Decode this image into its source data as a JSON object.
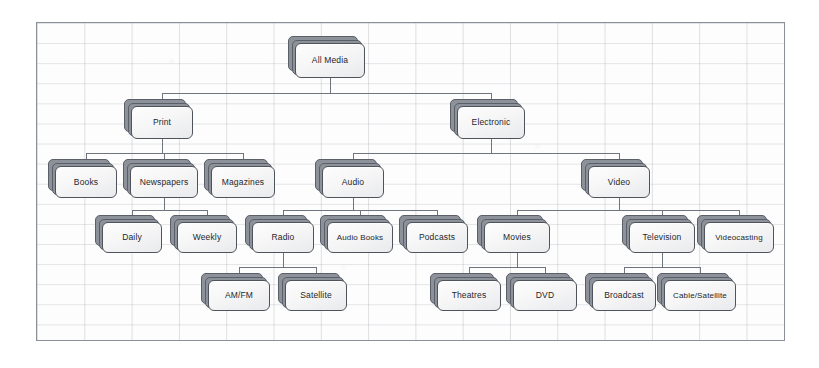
{
  "diagram": {
    "type": "tree",
    "canvas": {
      "background": "#fdfdfd",
      "grid": true,
      "border_color": "#8a8f99"
    },
    "node_style": {
      "fill": "#f6f6f7",
      "border": "#4f545c",
      "stack_fill": "#8d9199",
      "connector": "#6f757f"
    },
    "levels": [
      {
        "index": 0,
        "labels": [
          "All Media"
        ]
      },
      {
        "index": 1,
        "labels": [
          "Print",
          "Electronic"
        ]
      },
      {
        "index": 2,
        "labels": [
          "Books",
          "Newspapers",
          "Magazines",
          "Audio",
          "Video"
        ]
      },
      {
        "index": 3,
        "labels": [
          "Daily",
          "Weekly",
          "Radio",
          "Audio Books",
          "Podcasts",
          "Movies",
          "Television",
          "Videocasting"
        ]
      },
      {
        "index": 4,
        "labels": [
          "AM/FM",
          "Satellite",
          "Theatres",
          "DVD",
          "Broadcast",
          "Cable/Satellite"
        ]
      }
    ],
    "nodes": [
      {
        "id": "all-media",
        "label": "All Media",
        "level": 0,
        "parent": null,
        "x": 295,
        "y": 43,
        "w": 70,
        "h": 35
      },
      {
        "id": "print",
        "label": "Print",
        "level": 1,
        "parent": "all-media",
        "x": 131,
        "y": 106,
        "w": 62,
        "h": 33
      },
      {
        "id": "electronic",
        "label": "Electronic",
        "level": 1,
        "parent": "all-media",
        "x": 457,
        "y": 106,
        "w": 68,
        "h": 33
      },
      {
        "id": "books",
        "label": "Books",
        "level": 2,
        "parent": "print",
        "x": 55,
        "y": 166,
        "w": 62,
        "h": 32
      },
      {
        "id": "newspapers",
        "label": "Newspapers",
        "level": 2,
        "parent": "print",
        "x": 130,
        "y": 166,
        "w": 68,
        "h": 32
      },
      {
        "id": "magazines",
        "label": "Magazines",
        "level": 2,
        "parent": "print",
        "x": 211,
        "y": 166,
        "w": 64,
        "h": 32
      },
      {
        "id": "audio",
        "label": "Audio",
        "level": 2,
        "parent": "electronic",
        "x": 322,
        "y": 166,
        "w": 62,
        "h": 32
      },
      {
        "id": "video",
        "label": "Video",
        "level": 2,
        "parent": "electronic",
        "x": 588,
        "y": 166,
        "w": 62,
        "h": 32
      },
      {
        "id": "daily",
        "label": "Daily",
        "level": 3,
        "parent": "newspapers",
        "x": 102,
        "y": 222,
        "w": 60,
        "h": 31
      },
      {
        "id": "weekly",
        "label": "Weekly",
        "level": 3,
        "parent": "newspapers",
        "x": 177,
        "y": 222,
        "w": 60,
        "h": 31
      },
      {
        "id": "radio",
        "label": "Radio",
        "level": 3,
        "parent": "audio",
        "x": 252,
        "y": 222,
        "w": 62,
        "h": 31
      },
      {
        "id": "audio-books",
        "label": "Audio Books",
        "level": 3,
        "parent": "audio",
        "x": 327,
        "y": 222,
        "w": 66,
        "h": 31
      },
      {
        "id": "podcasts",
        "label": "Podcasts",
        "level": 3,
        "parent": "audio",
        "x": 406,
        "y": 222,
        "w": 62,
        "h": 31
      },
      {
        "id": "movies",
        "label": "Movies",
        "level": 3,
        "parent": "video",
        "x": 484,
        "y": 222,
        "w": 66,
        "h": 31
      },
      {
        "id": "television",
        "label": "Television",
        "level": 3,
        "parent": "video",
        "x": 629,
        "y": 222,
        "w": 66,
        "h": 31
      },
      {
        "id": "videocasting",
        "label": "Videocasting",
        "level": 3,
        "parent": "video",
        "x": 704,
        "y": 222,
        "w": 70,
        "h": 31
      },
      {
        "id": "am-fm",
        "label": "AM/FM",
        "level": 4,
        "parent": "radio",
        "x": 208,
        "y": 280,
        "w": 62,
        "h": 31
      },
      {
        "id": "satellite",
        "label": "Satellite",
        "level": 4,
        "parent": "radio",
        "x": 285,
        "y": 280,
        "w": 62,
        "h": 31
      },
      {
        "id": "theatres",
        "label": "Theatres",
        "level": 4,
        "parent": "movies",
        "x": 437,
        "y": 280,
        "w": 64,
        "h": 31
      },
      {
        "id": "dvd",
        "label": "DVD",
        "level": 4,
        "parent": "movies",
        "x": 513,
        "y": 280,
        "w": 64,
        "h": 31
      },
      {
        "id": "broadcast",
        "label": "Broadcast",
        "level": 4,
        "parent": "television",
        "x": 592,
        "y": 280,
        "w": 64,
        "h": 31
      },
      {
        "id": "cable-satellite",
        "label": "Cable/Satellite",
        "level": 4,
        "parent": "television",
        "x": 664,
        "y": 280,
        "w": 72,
        "h": 31
      }
    ]
  }
}
